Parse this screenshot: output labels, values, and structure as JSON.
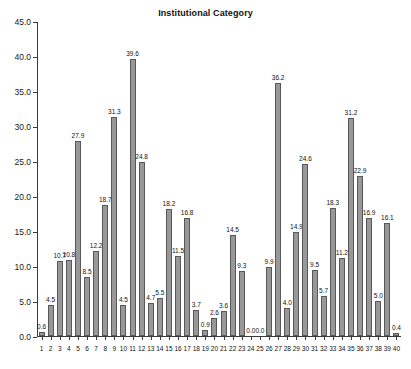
{
  "chart_data": {
    "type": "bar",
    "title": "Institutional Category",
    "xlabel": "",
    "ylabel": "",
    "ylim": [
      0,
      45
    ],
    "ytick_labels": [
      "0.0",
      "5.0",
      "10.0",
      "15.0",
      "20.0",
      "25.0",
      "30.0",
      "35.0",
      "40.0",
      "45.0"
    ],
    "ytick_values": [
      0,
      5,
      10,
      15,
      20,
      25,
      30,
      35,
      40,
      45
    ],
    "grid": false,
    "legend": "none",
    "bar_color": "#989898",
    "bar_edge_color": "#585858",
    "axis_color": "#3a3a3a",
    "categories": [
      "1",
      "2",
      "3",
      "4",
      "5",
      "6",
      "7",
      "8",
      "9",
      "10",
      "11",
      "12",
      "13",
      "14",
      "15",
      "16",
      "17",
      "18",
      "19",
      "20",
      "21",
      "22",
      "23",
      "24",
      "25",
      "26",
      "27",
      "28",
      "29",
      "30",
      "31",
      "32",
      "33",
      "34",
      "35",
      "36",
      "37",
      "38",
      "39",
      "40"
    ],
    "values": [
      0.6,
      4.5,
      10.7,
      10.8,
      27.9,
      8.5,
      12.2,
      18.7,
      31.3,
      4.5,
      39.6,
      24.8,
      4.7,
      5.5,
      18.2,
      11.5,
      16.8,
      3.7,
      0.9,
      2.6,
      3.6,
      14.5,
      9.3,
      0.0,
      0.0,
      9.9,
      36.2,
      4.0,
      14.9,
      24.6,
      9.5,
      5.7,
      18.3,
      11.2,
      31.2,
      22.9,
      16.9,
      5.0,
      16.1,
      0.4
    ],
    "value_labels": [
      "0.6",
      "4.5",
      "10.7",
      "10.8",
      "27.9",
      "8.5",
      "12.2",
      "18.7",
      "31.3",
      "4.5",
      "39.6",
      "24.8",
      "4.7",
      "5.5",
      "18.2",
      "11.5",
      "16.8",
      "3.7",
      "0.9",
      "2.6",
      "3.6",
      "14.5",
      "9.3",
      "0.0",
      "0.0",
      "9.9",
      "36.2",
      "4.0",
      "14.9",
      "24.6",
      "9.5",
      "5.7",
      "18.3",
      "11.2",
      "31.2",
      "22.9",
      "16.9",
      "5.0",
      "16.1",
      "0.4"
    ]
  }
}
